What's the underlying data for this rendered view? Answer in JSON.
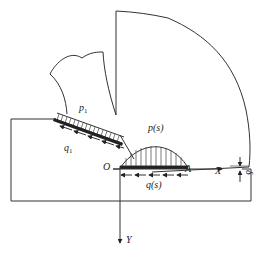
{
  "diagram": {
    "type": "cutting-mechanics-schematic",
    "labels": {
      "p1": "p",
      "p1_sub": "1",
      "q1": "q",
      "q1_sub": "1",
      "ps": "p(s)",
      "qs": "q(s)",
      "origin": "O",
      "pointA": "A",
      "axisX": "X",
      "axisY": "Y",
      "delta": "δ"
    },
    "elements": [
      "workpiece-block",
      "tool-body",
      "chip",
      "distributed-normal-load-p1",
      "distributed-shear-load-q1",
      "contact-pressure-p(s)",
      "friction-shear-q(s)",
      "x-axis",
      "y-axis",
      "clearance-gap-delta"
    ],
    "colors": {
      "stroke": "#333333",
      "background": "#ffffff"
    }
  }
}
